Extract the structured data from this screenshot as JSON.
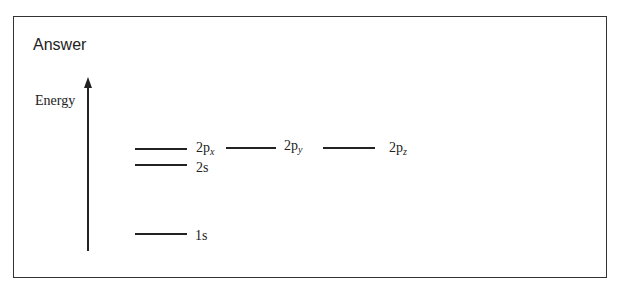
{
  "title": "Answer",
  "axis": {
    "label": "Energy",
    "icon": "up-arrow"
  },
  "levels": {
    "p2x": {
      "main": "2p",
      "sub": "x"
    },
    "p2y": {
      "main": "2p",
      "sub": "y"
    },
    "p2z": {
      "main": "2p",
      "sub": "z"
    },
    "s2": "2s",
    "s1": "1s"
  },
  "colors": {
    "line": "#222222",
    "background": "#ffffff"
  }
}
